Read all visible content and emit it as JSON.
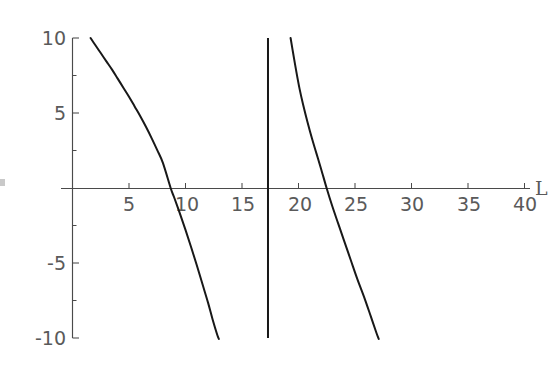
{
  "figure": {
    "background_color": "#ffffff",
    "curve_color": "#181818",
    "axis_color": "#4a4a4a",
    "label_color": "#5a5a5a"
  },
  "axes": {
    "x_title": "L",
    "y_title": "",
    "x_tick_labels": [
      "5",
      "10",
      "15",
      "20",
      "25",
      "30",
      "35",
      "40"
    ],
    "y_tick_labels": [
      "10",
      "5",
      "-5",
      "-10"
    ]
  },
  "chart_data": {
    "type": "line",
    "title": "",
    "subtitle": "",
    "xlabel": "L",
    "ylabel": "",
    "xlim": [
      0,
      42
    ],
    "ylim": [
      -10,
      10
    ],
    "x_ticks": [
      5,
      10,
      15,
      20,
      25,
      30,
      35,
      40
    ],
    "y_ticks": [
      10,
      5,
      -5,
      -10
    ],
    "grid": false,
    "legend": null,
    "legend_position": "none",
    "annotations": [],
    "vertical_asymptotes": [
      17.3
    ],
    "zero_crossings": [
      8.7,
      22.5
    ],
    "series": [
      {
        "name": "branch-1",
        "x": [
          1.6,
          2.0,
          2.5,
          3.0,
          3.5,
          4.0,
          4.5,
          5.0,
          5.5,
          6.0,
          6.5,
          7.0,
          7.5,
          8.0,
          8.7,
          9.0,
          9.5,
          10.0,
          10.5,
          11.0,
          11.5,
          12.0,
          12.4,
          12.8,
          12.95
        ],
        "y": [
          10.0,
          9.55,
          9.0,
          8.45,
          7.9,
          7.3,
          6.7,
          6.1,
          5.45,
          4.8,
          4.1,
          3.35,
          2.55,
          1.7,
          0.0,
          -0.6,
          -1.65,
          -2.75,
          -3.9,
          -5.1,
          -6.35,
          -7.6,
          -8.7,
          -9.7,
          -10.0
        ]
      },
      {
        "name": "branch-2",
        "x": [
          19.3,
          19.5,
          19.8,
          20.1,
          20.4,
          20.8,
          21.2,
          21.6,
          22.0,
          22.5,
          23.0,
          23.5,
          24.0,
          24.6,
          25.2,
          25.8,
          26.4,
          26.9,
          27.1
        ],
        "y": [
          10.0,
          9.1,
          7.8,
          6.6,
          5.6,
          4.4,
          3.3,
          2.3,
          1.3,
          0.0,
          -1.2,
          -2.3,
          -3.4,
          -4.7,
          -6.0,
          -7.2,
          -8.5,
          -9.6,
          -10.0
        ]
      }
    ]
  }
}
